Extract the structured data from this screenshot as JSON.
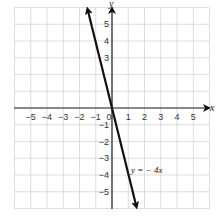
{
  "chart_data": {
    "type": "line",
    "title": "",
    "xlabel": "x",
    "ylabel": "y",
    "xlim": [
      -6,
      6
    ],
    "ylim": [
      -6,
      6
    ],
    "grid": true,
    "x_ticks": [
      "-5",
      "-4",
      "-3",
      "-2",
      "-1",
      "0",
      "1",
      "2",
      "3",
      "4",
      "5"
    ],
    "y_ticks": [
      "5",
      "4",
      "3",
      "-1",
      "-2",
      "-3",
      "-4",
      "-5"
    ],
    "series": [
      {
        "name": "y = − 4x",
        "equation": "y = -4x",
        "x": [
          -1.5,
          1.5
        ],
        "y": [
          6,
          -6
        ],
        "arrows": "both"
      }
    ],
    "annotations": [
      {
        "text": "y = − 4x",
        "x": 1.8,
        "y": -3.7
      }
    ]
  },
  "labels": {
    "x_axis": "x",
    "y_axis": "y",
    "equation": "y = − 4x",
    "x_ticks": [
      "−5",
      "−4",
      "−3",
      "−2",
      "−1",
      "0",
      "1",
      "2",
      "3",
      "4",
      "5"
    ],
    "y_ticks_pos": [
      "5",
      "4",
      "3"
    ],
    "y_ticks_neg": [
      "−1",
      "−2",
      "−3",
      "−4",
      "−5"
    ]
  }
}
